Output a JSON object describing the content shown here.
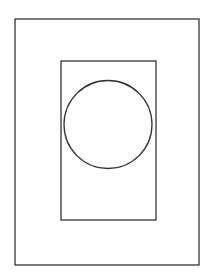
{
  "diagram": {
    "canvas": {
      "width": 210,
      "height": 273,
      "background": "#ffffff"
    },
    "stroke_color": "#333333",
    "shapes": {
      "outer_rect": {
        "x": 15,
        "y": 19,
        "width": 184,
        "height": 246,
        "stroke_width": 1.3
      },
      "inner_rect": {
        "x": 61,
        "y": 61,
        "width": 95,
        "height": 159,
        "stroke_width": 1.3
      },
      "circle": {
        "cx": 108,
        "cy": 124.5,
        "r": 44,
        "stroke_width": 1.3
      }
    }
  }
}
